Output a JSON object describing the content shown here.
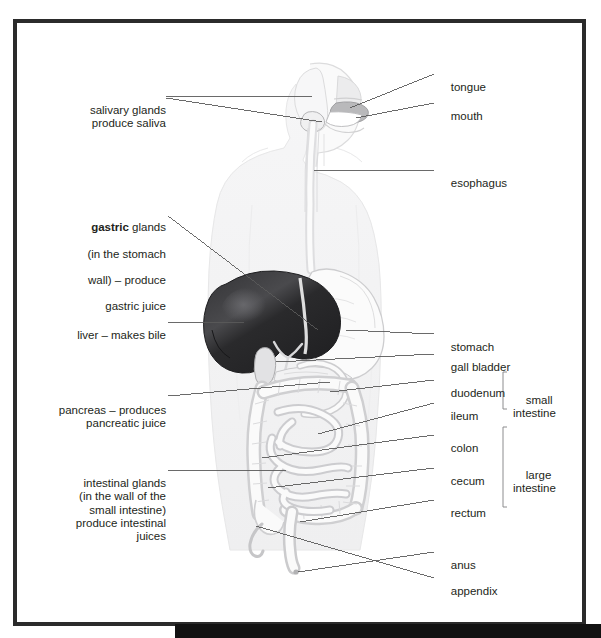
{
  "figure": {
    "frame_color": "#2b2b2b",
    "text_color": "#231f20",
    "leader_color": "#5a5a5a",
    "organ_dark": "#2e2e30",
    "organ_light": "#d8d8da",
    "body_outline": "#e9e9ea"
  },
  "left_labels": [
    {
      "id": "salivary-glands",
      "lines": [
        "salivary glands",
        "produce saliva"
      ],
      "text": "salivary glands\nproduce saliva",
      "bold_prefix": null,
      "x": 75,
      "y": 91,
      "width": 88
    },
    {
      "id": "gastric-glands",
      "lines": [
        "gastric glands",
        "(in the stomach",
        "wall) – produce",
        "gastric juice"
      ],
      "text": "gastric glands\n(in the stomach\nwall) – produce\ngastric juice",
      "bold_prefix": "gastric",
      "rest_first_line": " glands",
      "x": 72,
      "y": 208,
      "width": 94
    },
    {
      "id": "liver",
      "lines": [
        "liver – makes bile"
      ],
      "text": "liver – makes bile",
      "bold_prefix": null,
      "x": 62,
      "y": 316,
      "width": 104
    },
    {
      "id": "pancreas",
      "lines": [
        "pancreas – produces",
        "pancreatic juice"
      ],
      "text": "pancreas – produces\npancreatic juice",
      "bold_prefix": null,
      "x": 50,
      "y": 391,
      "width": 116
    },
    {
      "id": "intestinal-glands",
      "lines": [
        "intestinal glands",
        "(in the wall of the",
        "small intestine)",
        "produce intestinal",
        "juices"
      ],
      "text": "intestinal glands\n(in the wall of the\nsmall intestine)\nproduce intestinal\njuices",
      "bold_prefix": null,
      "x": 58,
      "y": 464,
      "width": 108
    }
  ],
  "right_labels": [
    {
      "id": "tongue",
      "text": "tongue",
      "x": 438,
      "y": 68
    },
    {
      "id": "mouth",
      "text": "mouth",
      "x": 438,
      "y": 97
    },
    {
      "id": "esophagus",
      "text": "esophagus",
      "x": 438,
      "y": 164
    },
    {
      "id": "stomach",
      "text": "stomach",
      "x": 438,
      "y": 328
    },
    {
      "id": "gall-bladder",
      "text": "gall bladder",
      "x": 438,
      "y": 348
    },
    {
      "id": "duodenum",
      "text": "duodenum",
      "x": 438,
      "y": 374
    },
    {
      "id": "ileum",
      "text": "ileum",
      "x": 438,
      "y": 397
    },
    {
      "id": "colon",
      "text": "colon",
      "x": 438,
      "y": 429
    },
    {
      "id": "cecum",
      "text": "cecum",
      "x": 438,
      "y": 462
    },
    {
      "id": "rectum",
      "text": "rectum",
      "x": 438,
      "y": 494
    },
    {
      "id": "anus",
      "text": "anus",
      "x": 438,
      "y": 546
    },
    {
      "id": "appendix",
      "text": "appendix",
      "x": 438,
      "y": 572
    }
  ],
  "bracket_groups": [
    {
      "id": "small-intestine",
      "lines": [
        "small",
        "intestine"
      ],
      "text": "small\nintestine",
      "members": [
        "duodenum",
        "ileum"
      ],
      "bracket_x": 503,
      "bracket_top": 372,
      "bracket_bottom": 409,
      "label_x": 513,
      "label_y": 381
    },
    {
      "id": "large-intestine",
      "lines": [
        "large",
        "intestine"
      ],
      "text": "large\nintestine",
      "members": [
        "colon",
        "cecum",
        "rectum"
      ],
      "bracket_x": 503,
      "bracket_top": 427,
      "bracket_bottom": 507,
      "label_x": 513,
      "label_y": 456
    }
  ]
}
